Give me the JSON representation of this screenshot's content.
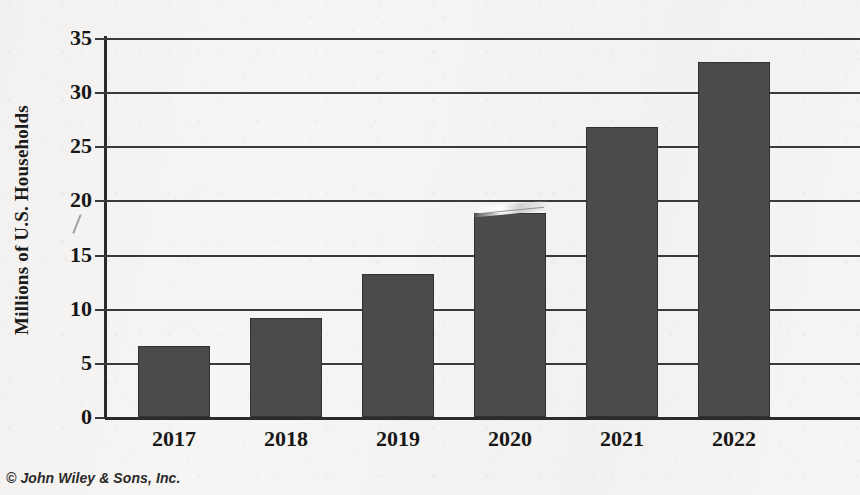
{
  "chart_data": {
    "type": "bar",
    "title": "",
    "subtitle": "",
    "xlabel": "",
    "ylabel": "Millions of U.S. Households",
    "categories": [
      "2017",
      "2018",
      "2019",
      "2020",
      "2021",
      "2022"
    ],
    "values": [
      6.6,
      9.1,
      13.2,
      18.8,
      26.8,
      32.8
    ],
    "series": [
      {
        "name": "U.S. Households",
        "values": [
          6.6,
          9.1,
          13.2,
          18.8,
          26.8,
          32.8
        ]
      }
    ],
    "ylim": [
      0,
      35
    ],
    "yticks": [
      0,
      5,
      10,
      15,
      20,
      25,
      30,
      35
    ],
    "ytick_labels": [
      "0",
      "5",
      "10",
      "15",
      "20",
      "25",
      "30",
      "35"
    ],
    "xtick_labels": [
      "2017",
      "2018",
      "2019",
      "2020",
      "2021",
      "2022"
    ],
    "grid": "horizontal",
    "legend": "none",
    "bar_color": "#4b4b4b",
    "axis_color": "#2b2b2b",
    "background_color": "#f6f5f3",
    "annotations": []
  },
  "credit": {
    "text": "© John Wiley & Sons, Inc."
  }
}
